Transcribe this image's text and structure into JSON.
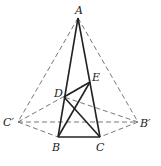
{
  "diagram": {
    "type": "geometry",
    "points": {
      "A": {
        "label": "A",
        "x": 78,
        "y": 18
      },
      "B": {
        "label": "B",
        "x": 58,
        "y": 137
      },
      "C": {
        "label": "C",
        "x": 100,
        "y": 137
      },
      "D": {
        "label": "D",
        "x": 64,
        "y": 97
      },
      "E": {
        "label": "E",
        "x": 90,
        "y": 82
      },
      "Cp": {
        "label": "C′",
        "x": 18,
        "y": 122
      },
      "Bp": {
        "label": "B′",
        "x": 138,
        "y": 122
      }
    },
    "label_positions": {
      "A": {
        "x": 75,
        "y": 14
      },
      "B": {
        "x": 52,
        "y": 151
      },
      "C": {
        "x": 96,
        "y": 151
      },
      "D": {
        "x": 54,
        "y": 97
      },
      "E": {
        "x": 92,
        "y": 81
      },
      "Cp": {
        "x": 3,
        "y": 126
      },
      "Bp": {
        "x": 140,
        "y": 127
      }
    },
    "solid_segments": [
      [
        "A",
        "B"
      ],
      [
        "A",
        "C"
      ],
      [
        "B",
        "C"
      ],
      [
        "D",
        "E"
      ],
      [
        "B",
        "E"
      ],
      [
        "D",
        "C"
      ]
    ],
    "dashed_segments": [
      [
        "A",
        "Cp"
      ],
      [
        "A",
        "Bp"
      ],
      [
        "Cp",
        "Bp"
      ],
      [
        "Cp",
        "B"
      ],
      [
        "Bp",
        "C"
      ],
      [
        "Cp",
        "E"
      ],
      [
        "Bp",
        "D"
      ]
    ]
  }
}
